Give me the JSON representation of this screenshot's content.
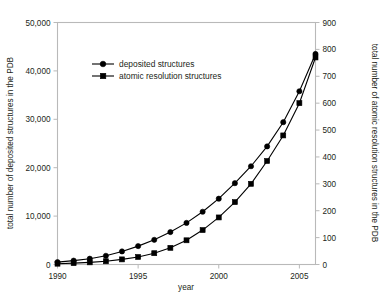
{
  "chart_data": {
    "type": "line",
    "title": "",
    "xlabel": "year",
    "ylabel": "total number of deposited structures in the PDB",
    "y2label": "total number of atomic resolution structures in the PDB",
    "xlim": [
      1990,
      2006
    ],
    "ylim": [
      0,
      50000
    ],
    "y2lim": [
      0,
      900
    ],
    "xticks": [
      1990,
      1995,
      2000,
      2005
    ],
    "xtick_labels": [
      "1990",
      "1995",
      "2000",
      "2005"
    ],
    "yticks": [
      0,
      10000,
      20000,
      30000,
      40000,
      50000
    ],
    "ytick_labels": [
      "0",
      "10,000",
      "20,000",
      "30,000",
      "40,000",
      "50,000"
    ],
    "y2ticks": [
      0,
      100,
      200,
      300,
      400,
      500,
      600,
      700,
      800,
      900
    ],
    "y2tick_labels": [
      "0",
      "100",
      "200",
      "300",
      "400",
      "500",
      "600",
      "700",
      "800",
      "900"
    ],
    "grid": false,
    "legend_position": "upper-left-inside",
    "x": [
      1990,
      1991,
      1992,
      1993,
      1994,
      1995,
      1996,
      1997,
      1998,
      1999,
      2000,
      2001,
      2002,
      2003,
      2004,
      2005,
      2006
    ],
    "series": [
      {
        "name": "deposited structures",
        "marker": "circle",
        "axis": "left",
        "values": [
          500,
          800,
          1200,
          1800,
          2700,
          3800,
          5100,
          6700,
          8600,
          10900,
          13600,
          16800,
          20300,
          24400,
          29400,
          35800,
          43500
        ]
      },
      {
        "name": "atomic resolution structures",
        "marker": "square",
        "axis": "right",
        "values": [
          3,
          5,
          8,
          12,
          19,
          28,
          42,
          62,
          90,
          128,
          175,
          232,
          300,
          385,
          480,
          600,
          770
        ]
      }
    ]
  },
  "legend": {
    "entries": [
      {
        "label": "deposited structures",
        "marker": "circle"
      },
      {
        "label": "atomic resolution structures",
        "marker": "square"
      }
    ]
  },
  "axes": {
    "left_title": "total number of deposited structures in the PDB",
    "right_title": "total number of atomic resolution structures in the PDB",
    "bottom_title": "year"
  },
  "colors": {
    "series": "#000000",
    "frame": "#b9b9b9",
    "text": "#231f20",
    "background": "#ffffff"
  }
}
